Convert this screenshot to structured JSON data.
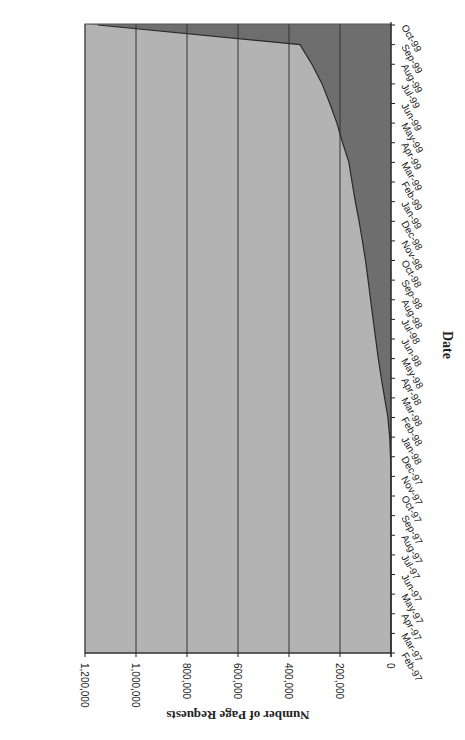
{
  "chart_data": {
    "type": "area",
    "orientation": "rotated-90-clockwise",
    "title": "",
    "xlabel": "Date",
    "ylabel": "Number of Page Requests",
    "ylim": [
      0,
      1200000
    ],
    "yticks": [
      0,
      200000,
      400000,
      600000,
      800000,
      1000000,
      1200000
    ],
    "ytick_labels": [
      "0",
      "200,000",
      "400,000",
      "600,000",
      "800,000",
      "1,000,000",
      "1,200,000"
    ],
    "grid": "horizontal major gridlines",
    "legend": "none",
    "categories": [
      "Feb-97",
      "Mar-97",
      "Apr-97",
      "May-97",
      "Jun-97",
      "Jul-97",
      "Aug-97",
      "Sep-97",
      "Oct-97",
      "Nov-97",
      "Dec-97",
      "Jan-98",
      "Feb-98",
      "Mar-98",
      "Apr-98",
      "May-98",
      "Jun-98",
      "Jul-98",
      "Aug-98",
      "Sep-98",
      "Oct-98",
      "Nov-98",
      "Dec-98",
      "Jan-99",
      "Feb-99",
      "Mar-99",
      "Apr-99",
      "May-99",
      "Jun-99",
      "Jul-99",
      "Aug-99",
      "Sep-99",
      "Oct-99"
    ],
    "series": [
      {
        "name": "Page Requests",
        "values": [
          0,
          0,
          0,
          0,
          0,
          0,
          0,
          0,
          0,
          0,
          2000,
          5000,
          12000,
          25000,
          38000,
          50000,
          60000,
          70000,
          80000,
          90000,
          100000,
          112000,
          125000,
          140000,
          153000,
          165000,
          190000,
          212000,
          240000,
          270000,
          310000,
          357000,
          1150000
        ]
      }
    ],
    "colors": {
      "area": "#b3b3b3",
      "background": "#6e6e6e",
      "line": "#2a2a2a",
      "grid": "#333333"
    }
  },
  "labels": {
    "date_axis_title": "Date",
    "value_axis_title": "Number of Page Requests"
  }
}
